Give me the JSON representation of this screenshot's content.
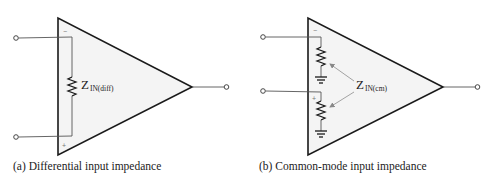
{
  "diagram_a": {
    "caption": "(a) Differential input impedance",
    "impedance_label_main": "Z",
    "impedance_label_sub": "IN(diff)",
    "inverting_sign": "−",
    "noninverting_sign": "+"
  },
  "diagram_b": {
    "caption": "(b) Common-mode input impedance",
    "impedance_label_main": "Z",
    "impedance_label_sub": "IN(cm)",
    "inverting_sign": "−",
    "noninverting_sign": "+"
  },
  "colors": {
    "triangle_fill": "#f4f4f4",
    "stroke": "#1a1a1a",
    "wire": "#555555",
    "arrow": "#999999"
  }
}
